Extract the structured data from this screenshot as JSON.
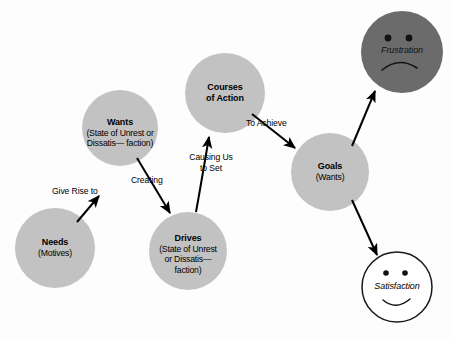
{
  "diagram": {
    "background_color": "#fdfdfd",
    "node_fill": "#c2c2c2",
    "dark_face_fill": "#6b6b6b",
    "light_face_fill": "#ffffff",
    "stroke_color": "#000000",
    "nodes": [
      {
        "id": "needs",
        "title": "Needs",
        "subtitle": "(Motives)",
        "cx": 55,
        "cy": 248,
        "r": 40,
        "fill": "#c2c2c2"
      },
      {
        "id": "wants",
        "title": "Wants",
        "subtitle": "(Desires)",
        "cx": 120,
        "cy": 128,
        "r": 38,
        "fill": "#c2c2c2"
      },
      {
        "id": "drives",
        "title": "Drives",
        "subtitle": "(State of Unrest\nor Dissatis—\nfaction)",
        "cx": 188,
        "cy": 251,
        "r": 39,
        "fill": "#c2c2c2"
      },
      {
        "id": "courses-of-action",
        "title": "Courses\nof Action",
        "subtitle": "",
        "cx": 225,
        "cy": 93,
        "r": 40,
        "fill": "#c2c2c2"
      },
      {
        "id": "goals",
        "title": "Goals",
        "subtitle": "(Wants)",
        "cx": 330,
        "cy": 172,
        "r": 39,
        "fill": "#c2c2c2"
      }
    ],
    "faces": [
      {
        "id": "frustration",
        "label": "Frustration",
        "cx": 402,
        "cy": 52,
        "r": 41,
        "fill": "#6b6b6b",
        "mood": "sad"
      },
      {
        "id": "satisfaction",
        "label": "Satisfaction",
        "cx": 397,
        "cy": 287,
        "r": 35,
        "fill": "#ffffff",
        "mood": "happy"
      }
    ],
    "edges": [
      {
        "id": "needs-to-wants",
        "label": "Give Rise to",
        "from": "needs",
        "to": "wants",
        "label_x": 52,
        "label_y": 186,
        "label_align": "left"
      },
      {
        "id": "wants-to-drives",
        "label": "Creating",
        "from": "wants",
        "to": "drives",
        "label_x": 131,
        "label_y": 175,
        "label_align": "left"
      },
      {
        "id": "drives-to-courses",
        "label": "Causing Us\nto Set",
        "from": "drives",
        "to": "courses-of-action",
        "label_x": 182,
        "label_y": 152,
        "label_align": "center"
      },
      {
        "id": "courses-to-goals",
        "label": "To Achieve",
        "from": "courses-of-action",
        "to": "goals",
        "label_x": 246,
        "label_y": 118,
        "label_align": "left"
      },
      {
        "id": "goals-to-frustration",
        "label": "",
        "from": "goals",
        "to": "frustration",
        "label_x": 0,
        "label_y": 0,
        "label_align": "center"
      },
      {
        "id": "goals-to-satisfaction",
        "label": "",
        "from": "goals",
        "to": "satisfaction",
        "label_x": 0,
        "label_y": 0,
        "label_align": "center"
      }
    ]
  }
}
